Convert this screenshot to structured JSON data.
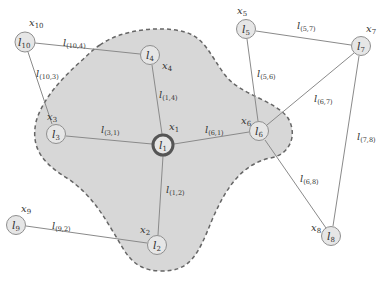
{
  "diagram": {
    "type": "graph",
    "colors": {
      "region_fill": "#d7d7d7",
      "region_border": "#666666",
      "node_fill": "#e6e6e6",
      "node_border": "#8f8f8f",
      "focus_node_border": "#555555",
      "edge": "#8a8a8a"
    },
    "region": {
      "label": "neighborhood of l1",
      "style": "dashed"
    },
    "nodes": [
      {
        "id": "1",
        "label": "l",
        "sub": "1",
        "var": "x",
        "var_sub": "1",
        "focus": true
      },
      {
        "id": "2",
        "label": "l",
        "sub": "2",
        "var": "x",
        "var_sub": "2"
      },
      {
        "id": "3",
        "label": "l",
        "sub": "3",
        "var": "x",
        "var_sub": "3"
      },
      {
        "id": "4",
        "label": "l",
        "sub": "4",
        "var": "x",
        "var_sub": "4"
      },
      {
        "id": "5",
        "label": "l",
        "sub": "5",
        "var": "x",
        "var_sub": "5"
      },
      {
        "id": "6",
        "label": "l",
        "sub": "6",
        "var": "x",
        "var_sub": "6"
      },
      {
        "id": "7",
        "label": "l",
        "sub": "7",
        "var": "x",
        "var_sub": "7"
      },
      {
        "id": "8",
        "label": "l",
        "sub": "8",
        "var": "x",
        "var_sub": "8"
      },
      {
        "id": "9",
        "label": "l",
        "sub": "9",
        "var": "x",
        "var_sub": "9"
      },
      {
        "id": "10",
        "label": "l",
        "sub": "10",
        "var": "x",
        "var_sub": "10"
      }
    ],
    "edges": [
      {
        "from": "10",
        "to": "4",
        "label": "l",
        "sub": "(10,4)"
      },
      {
        "from": "10",
        "to": "3",
        "label": "l",
        "sub": "(10,3)"
      },
      {
        "from": "1",
        "to": "4",
        "label": "l",
        "sub": "(1,4)"
      },
      {
        "from": "3",
        "to": "1",
        "label": "l",
        "sub": "(3,1)"
      },
      {
        "from": "6",
        "to": "1",
        "label": "l",
        "sub": "(6,1)"
      },
      {
        "from": "1",
        "to": "2",
        "label": "l",
        "sub": "(1,2)"
      },
      {
        "from": "9",
        "to": "2",
        "label": "l",
        "sub": "(9,2)"
      },
      {
        "from": "5",
        "to": "7",
        "label": "l",
        "sub": "(5,7)"
      },
      {
        "from": "5",
        "to": "6",
        "label": "l",
        "sub": "(5,6)"
      },
      {
        "from": "6",
        "to": "7",
        "label": "l",
        "sub": "(6,7)"
      },
      {
        "from": "7",
        "to": "8",
        "label": "l",
        "sub": "(7,8)"
      },
      {
        "from": "6",
        "to": "8",
        "label": "l",
        "sub": "(6,8)"
      }
    ]
  }
}
